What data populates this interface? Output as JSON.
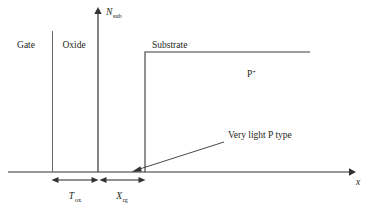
{
  "figure": {
    "kind": "semiconductor-doping-profile-diagram",
    "background_color": "#ffffff",
    "line_color": "#3a3a3a",
    "text_color": "#231f20"
  },
  "axes": {
    "y_axis": {
      "label_var": "N",
      "label_sub": "sub",
      "label_full": "N sub",
      "x_position": 98,
      "top": 10,
      "bottom": 172
    },
    "x_axis": {
      "label_var": "x",
      "y_position": 172,
      "left": 8,
      "right": 352
    }
  },
  "regions": [
    {
      "id": "gate",
      "label": "Gate",
      "text_x": 26,
      "text_y": 48
    },
    {
      "id": "oxide",
      "label": "Oxide",
      "text_x": 74,
      "text_y": 48
    },
    {
      "id": "substrate",
      "label": "Substrate",
      "text_x": 152,
      "text_y": 48
    }
  ],
  "boundaries": {
    "gate_oxide_x": 52,
    "oxide_substrate_x": 98,
    "depletion_edge_x": 145,
    "boundary_top_y": 31
  },
  "profile": {
    "step_x": 145,
    "plateau_y": 52,
    "plateau_end_x": 310,
    "riser_bottom_y": 172
  },
  "doping_label": {
    "base": "P",
    "superscript": "+",
    "full": "P+",
    "text_x": 247,
    "text_y": 77
  },
  "annotation": {
    "text": "Very light P type",
    "text_x": 228,
    "text_y": 138,
    "leader_start_x": 224,
    "leader_start_y": 142,
    "leader_end_x": 134,
    "leader_end_y": 171
  },
  "dimensions": [
    {
      "id": "tox",
      "label_var": "T",
      "label_sub": "ox",
      "label_full": "T ox",
      "start_x": 52,
      "end_x": 98,
      "line_y": 180,
      "text_x": 75,
      "text_y": 199
    },
    {
      "id": "xrg",
      "label_var": "X",
      "label_sub": "rg",
      "label_full": "X rg",
      "start_x": 100,
      "end_x": 145,
      "line_y": 180,
      "text_x": 122,
      "text_y": 199
    }
  ]
}
